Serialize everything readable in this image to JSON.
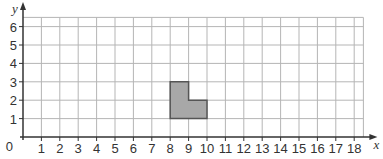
{
  "chart_data": {
    "type": "grid-diagram",
    "title": "",
    "xlabel": "x",
    "ylabel": "y",
    "xlim": [
      0,
      18.5
    ],
    "ylim": [
      0,
      6.5
    ],
    "x_ticks": [
      1,
      2,
      3,
      4,
      5,
      6,
      7,
      8,
      9,
      10,
      11,
      12,
      13,
      14,
      15,
      16,
      17,
      18
    ],
    "y_ticks": [
      1,
      2,
      3,
      4,
      5,
      6
    ],
    "origin_label": "0",
    "grid": true,
    "shape": {
      "name": "L-shape",
      "fill": "#a8a8a8",
      "stroke": "#555555",
      "vertices": [
        [
          8,
          1
        ],
        [
          10,
          1
        ],
        [
          10,
          2
        ],
        [
          9,
          2
        ],
        [
          9,
          3
        ],
        [
          8,
          3
        ]
      ]
    }
  },
  "colors": {
    "grid": "#b5b5b5",
    "axis": "#333333",
    "shape_fill": "#a8a8a8",
    "shape_stroke": "#555555"
  }
}
